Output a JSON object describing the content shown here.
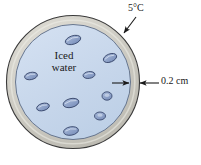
{
  "figure": {
    "labels": {
      "temperature": "5°C",
      "thickness": "0.2 cm",
      "contents_line1": "Iced",
      "contents_line2": "water"
    },
    "colors": {
      "shell_fill": "#c9c7bf",
      "shell_fill_light": "#dedcd4",
      "water_fill": "#c6d6ea",
      "ice_fill": "#8ea3c8",
      "ice_stroke": "#2f3e63",
      "outline": "#3a3a3a",
      "text": "#1a1a1a",
      "background": "#ffffff"
    },
    "geometry": {
      "center_x": 73,
      "center_y": 82,
      "outer_radius": 67,
      "inner_radius": 58,
      "shell_thickness_px": 9
    },
    "ice_chunks": [
      {
        "cx": 73,
        "cy": 40,
        "rx": 8.0,
        "ry": 4.2,
        "rot": -18
      },
      {
        "cx": 110,
        "cy": 58,
        "rx": 7.0,
        "ry": 4.0,
        "rot": -22
      },
      {
        "cx": 31,
        "cy": 76,
        "rx": 6.5,
        "ry": 3.6,
        "rot": -12
      },
      {
        "cx": 89,
        "cy": 75,
        "rx": 6.0,
        "ry": 3.4,
        "rot": -8
      },
      {
        "cx": 107,
        "cy": 96,
        "rx": 5.0,
        "ry": 4.2,
        "rot": 0
      },
      {
        "cx": 71,
        "cy": 103,
        "rx": 8.0,
        "ry": 4.4,
        "rot": -14
      },
      {
        "cx": 43,
        "cy": 107,
        "rx": 6.5,
        "ry": 3.6,
        "rot": -16
      },
      {
        "cx": 100,
        "cy": 116,
        "rx": 5.5,
        "ry": 4.0,
        "rot": 0
      },
      {
        "cx": 71,
        "cy": 131,
        "rx": 7.5,
        "ry": 4.2,
        "rot": -10
      }
    ],
    "annotations": {
      "temperature_leader": {
        "x1": 134,
        "y1": 18,
        "x2": 123,
        "y2": 33
      },
      "thickness_arrow_left": {
        "x1": 112,
        "y1": 83,
        "x2": 128,
        "y2": 83
      },
      "thickness_arrow_right": {
        "x1": 158,
        "y1": 83,
        "x2": 141,
        "y2": 83
      }
    }
  }
}
